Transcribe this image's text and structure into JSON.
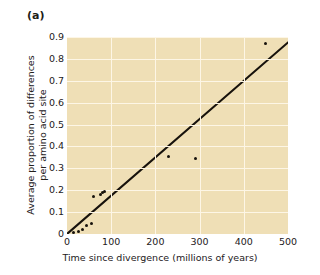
{
  "figure": {
    "panel_label": "(a)",
    "background_color": "#ffffff",
    "plot_background_color": "#efdfb6",
    "gridline_color": "#fdf6e6",
    "marker_color": "#17120c",
    "line_color": "#17120c"
  },
  "chart_data": {
    "type": "scatter",
    "title": "(a)",
    "xlabel": "Time since divergence (millions of years)",
    "ylabel": "Average proportion of differences per amino acid site",
    "ylabel_lines": [
      "Average proportion of differences",
      "per amino acid site"
    ],
    "xlim": [
      0,
      500
    ],
    "ylim": [
      0,
      0.9
    ],
    "xticks": [
      0,
      100,
      200,
      300,
      400,
      500
    ],
    "xtick_labels": [
      "0",
      "100",
      "200",
      "300",
      "400",
      "500"
    ],
    "yticks": [
      0,
      0.1,
      0.2,
      0.3,
      0.4,
      0.5,
      0.6,
      0.7,
      0.8,
      0.9
    ],
    "ytick_labels": [
      "0",
      "0.1",
      "0.2",
      "0.3",
      "0.4",
      "0.5",
      "0.6",
      "0.7",
      "0.8",
      "0.9"
    ],
    "grid": true,
    "grid_color": "#fdf6e6",
    "legend": null,
    "x": [
      15,
      25,
      35,
      45,
      55,
      60,
      75,
      80,
      85,
      230,
      290,
      450
    ],
    "y": [
      0.005,
      0.01,
      0.02,
      0.04,
      0.05,
      0.17,
      0.18,
      0.19,
      0.195,
      0.355,
      0.345,
      0.87
    ],
    "points": [
      {
        "x": 15,
        "y": 0.005
      },
      {
        "x": 25,
        "y": 0.01
      },
      {
        "x": 35,
        "y": 0.02
      },
      {
        "x": 45,
        "y": 0.04
      },
      {
        "x": 55,
        "y": 0.05
      },
      {
        "x": 60,
        "y": 0.17
      },
      {
        "x": 75,
        "y": 0.18
      },
      {
        "x": 80,
        "y": 0.19
      },
      {
        "x": 85,
        "y": 0.195
      },
      {
        "x": 230,
        "y": 0.355
      },
      {
        "x": 290,
        "y": 0.345
      },
      {
        "x": 450,
        "y": 0.87
      }
    ],
    "trend_line": {
      "type": "line",
      "x": [
        0,
        500
      ],
      "y": [
        0.0,
        0.875
      ],
      "slope": 0.00175,
      "intercept": 0.0
    }
  }
}
